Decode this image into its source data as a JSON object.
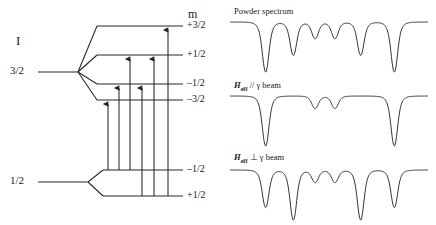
{
  "figure": {
    "kind": "moessbauer-zeeman-splitting",
    "stroke_color": "#262626",
    "background": "#ffffff"
  },
  "level_diagram": {
    "spin_header": "I",
    "m_header": "m",
    "excited_state": {
      "spin_label": "3/2",
      "sublevels": [
        {
          "m": "+3/2"
        },
        {
          "m": "+1/2"
        },
        {
          "m": "–1/2"
        },
        {
          "m": "–3/2"
        }
      ]
    },
    "ground_state": {
      "spin_label": "1/2",
      "sublevels": [
        {
          "m": "–1/2"
        },
        {
          "m": "+1/2"
        }
      ]
    },
    "transitions": [
      {
        "index": 1,
        "from": "–1/2",
        "to": "–3/2",
        "delta_m": "–1"
      },
      {
        "index": 2,
        "from": "–1/2",
        "to": "–1/2",
        "delta_m": "0"
      },
      {
        "index": 3,
        "from": "–1/2",
        "to": "+1/2",
        "delta_m": "+1"
      },
      {
        "index": 4,
        "from": "+1/2",
        "to": "–1/2",
        "delta_m": "–1"
      },
      {
        "index": 5,
        "from": "+1/2",
        "to": "+1/2",
        "delta_m": "0"
      },
      {
        "index": 6,
        "from": "+1/2",
        "to": "+3/2",
        "delta_m": "+1"
      }
    ]
  },
  "spectra": [
    {
      "id": "powder",
      "title_plain": "Powder spectrum",
      "title_rich": false,
      "relative_intensities": [
        3,
        2,
        1,
        1,
        2,
        3
      ],
      "line_positions": [
        0.18,
        0.32,
        0.43,
        0.53,
        0.66,
        0.83
      ]
    },
    {
      "id": "h-parallel-gamma",
      "title_plain": "Heff // γ beam",
      "title_rich": true,
      "title_symbol": "H",
      "title_sub": "eff",
      "title_rest": " // γ beam",
      "relative_intensities": [
        4,
        0,
        1,
        1,
        0,
        4
      ],
      "line_positions": [
        0.18,
        0.32,
        0.43,
        0.53,
        0.66,
        0.83
      ]
    },
    {
      "id": "h-perpendicular-gamma",
      "title_plain": "Heff ⊥ γ beam",
      "title_rich": true,
      "title_symbol": "H",
      "title_sub": "eff",
      "title_rest": " ⊥ γ beam",
      "relative_intensities": [
        3,
        4,
        1,
        1,
        4,
        3
      ],
      "line_positions": [
        0.18,
        0.32,
        0.43,
        0.53,
        0.66,
        0.83
      ]
    }
  ]
}
